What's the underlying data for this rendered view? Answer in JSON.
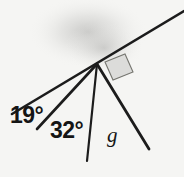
{
  "figure": {
    "name": "angle-diagram",
    "width": 184,
    "height": 177,
    "background_color": "#f5f5f3",
    "ink_color": "#1c1c1c",
    "smudge_color": "#c9c9c9"
  },
  "labels": {
    "angle_1": {
      "value": "19",
      "degree_symbol": "°",
      "text": "19°"
    },
    "angle_2": {
      "value": "32",
      "degree_symbol": "°",
      "text": "32°"
    },
    "unknown_angle": {
      "text": "g"
    }
  },
  "geometry": {
    "vertex": {
      "x": 97,
      "y": 64
    },
    "baseline": {
      "name": "inclined-line",
      "x1": 12,
      "y1": 114,
      "x2": 184,
      "y2": 11,
      "stroke_width": 2.6
    },
    "rays": [
      {
        "name": "ray-19",
        "x1": 97,
        "y1": 64,
        "x2": 37,
        "y2": 129,
        "stroke_width": 2.6
      },
      {
        "name": "ray-32",
        "x1": 97,
        "y1": 64,
        "x2": 87,
        "y2": 161,
        "stroke_width": 2.2
      },
      {
        "name": "ray-g",
        "x1": 97,
        "y1": 64,
        "x2": 149,
        "y2": 149,
        "stroke_width": 2.8
      }
    ],
    "square": {
      "name": "shaded-square",
      "points": "105,62 125,54 133,72 113,80",
      "fill": "#dcdcda",
      "stroke": "#6e6e6c",
      "stroke_width": 1.2
    },
    "smudge": {
      "cx": 88,
      "cy": 30,
      "rx": 58,
      "ry": 34,
      "opacity": 0.5
    }
  }
}
